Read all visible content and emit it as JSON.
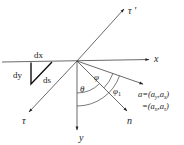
{
  "diagram": {
    "labels": {
      "x_axis": "x",
      "y_axis": "y",
      "tau_axis": "τ",
      "tau_prime_axis": "τ '",
      "n_axis": "n",
      "dx": "dx",
      "dy": "dy",
      "ds": "ds",
      "theta": "θ",
      "phi": "φ",
      "phi1": "φ",
      "phi1_sub": "1",
      "a_line1_prefix": "a=(a",
      "a_line1_sub1": "y",
      "a_line1_mid": ",a",
      "a_line1_sub2": "x",
      "a_line1_suffix": ")",
      "a_line2_prefix": "=(a",
      "a_line2_sub1": "n",
      "a_line2_mid": ",a",
      "a_line2_sub2": "τ",
      "a_line2_suffix": ")"
    },
    "colors": {
      "line": "#333333",
      "triangle": "#111111",
      "text": "#222222",
      "background": "#ffffff"
    }
  }
}
